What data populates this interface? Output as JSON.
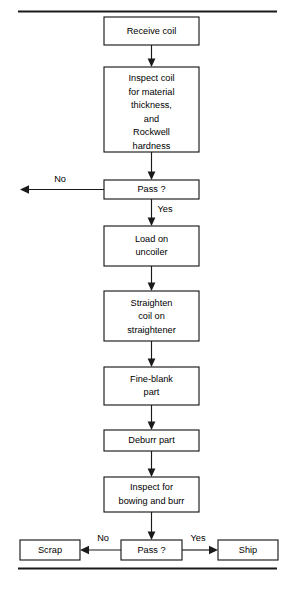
{
  "diagram": {
    "type": "flowchart",
    "orientation": "top-to-bottom",
    "background_color": "#ffffff",
    "line_color": "#1a1a1a",
    "text_color": "#000000",
    "rules": {
      "top_rule": "horizontal-rule-top",
      "bottom_rule": "horizontal-rule-bottom"
    },
    "nodes": [
      {
        "id": "receive-coil",
        "shape": "rect",
        "lines": [
          "Receive coil"
        ],
        "x": 104,
        "y": 17,
        "w": 95,
        "h": 28
      },
      {
        "id": "inspect-coil",
        "shape": "rect",
        "lines": [
          "Inspect coil",
          "for material",
          "thickness,",
          "and",
          "Rockwell",
          "hardness"
        ],
        "x": 104,
        "y": 67,
        "w": 95,
        "h": 85
      },
      {
        "id": "pass-1",
        "shape": "rect",
        "lines": [
          "Pass ?"
        ],
        "x": 104,
        "y": 180,
        "w": 95,
        "h": 19
      },
      {
        "id": "load-on-uncoiler",
        "shape": "rect",
        "lines": [
          "Load on",
          "uncoiler"
        ],
        "x": 104,
        "y": 226,
        "w": 95,
        "h": 40
      },
      {
        "id": "straighten-coil",
        "shape": "rect",
        "lines": [
          "Straighten",
          "coil on",
          "straightener"
        ],
        "x": 104,
        "y": 291,
        "w": 95,
        "h": 50
      },
      {
        "id": "fine-blank-part",
        "shape": "rect",
        "lines": [
          "Fine-blank",
          "part"
        ],
        "x": 104,
        "y": 367,
        "w": 95,
        "h": 38
      },
      {
        "id": "deburr-part",
        "shape": "rect",
        "lines": [
          "Deburr part"
        ],
        "x": 104,
        "y": 430,
        "w": 95,
        "h": 21
      },
      {
        "id": "inspect-bowing-burr",
        "shape": "rect",
        "lines": [
          "Inspect for",
          "bowing and burr"
        ],
        "x": 104,
        "y": 477,
        "w": 95,
        "h": 35
      },
      {
        "id": "pass-2",
        "shape": "rect",
        "lines": [
          "Pass ?"
        ],
        "x": 121,
        "y": 540,
        "w": 61,
        "h": 20
      },
      {
        "id": "scrap",
        "shape": "rect",
        "lines": [
          "Scrap"
        ],
        "x": 20,
        "y": 540,
        "w": 60,
        "h": 20
      },
      {
        "id": "ship",
        "shape": "rect",
        "lines": [
          "Ship"
        ],
        "x": 218,
        "y": 540,
        "w": 60,
        "h": 20
      }
    ],
    "edges": [
      {
        "id": "e-receive-to-inspect",
        "from": "receive-coil",
        "to": "inspect-coil",
        "label": "",
        "direction": "down"
      },
      {
        "id": "e-inspect-to-pass1",
        "from": "inspect-coil",
        "to": "pass-1",
        "label": "",
        "direction": "down"
      },
      {
        "id": "e-pass1-no",
        "from": "pass-1",
        "to": "exit-left",
        "label": "No",
        "direction": "left"
      },
      {
        "id": "e-pass1-yes",
        "from": "pass-1",
        "to": "load-on-uncoiler",
        "label": "Yes",
        "direction": "down"
      },
      {
        "id": "e-load-to-straighten",
        "from": "load-on-uncoiler",
        "to": "straighten-coil",
        "label": "",
        "direction": "down"
      },
      {
        "id": "e-straighten-to-fineblank",
        "from": "straighten-coil",
        "to": "fine-blank-part",
        "label": "",
        "direction": "down"
      },
      {
        "id": "e-fineblank-to-deburr",
        "from": "fine-blank-part",
        "to": "deburr-part",
        "label": "",
        "direction": "down"
      },
      {
        "id": "e-deburr-to-inspect2",
        "from": "deburr-part",
        "to": "inspect-bowing-burr",
        "label": "",
        "direction": "down"
      },
      {
        "id": "e-inspect2-to-pass2",
        "from": "inspect-bowing-burr",
        "to": "pass-2",
        "label": "",
        "direction": "down"
      },
      {
        "id": "e-pass2-no",
        "from": "pass-2",
        "to": "scrap",
        "label": "No",
        "direction": "left"
      },
      {
        "id": "e-pass2-yes",
        "from": "pass-2",
        "to": "ship",
        "label": "Yes",
        "direction": "right"
      }
    ],
    "labels": {
      "no_1": "No",
      "yes_1": "Yes",
      "no_2": "No",
      "yes_2": "Yes"
    },
    "text": {
      "receive_coil": "Receive coil",
      "inspect_coil_l1": "Inspect coil",
      "inspect_coil_l2": "for material",
      "inspect_coil_l3": "thickness,",
      "inspect_coil_l4": "and",
      "inspect_coil_l5": "Rockwell",
      "inspect_coil_l6": "hardness",
      "pass_1": "Pass ?",
      "load_l1": "Load on",
      "load_l2": "uncoiler",
      "straighten_l1": "Straighten",
      "straighten_l2": "coil on",
      "straighten_l3": "straightener",
      "fineblank_l1": "Fine-blank",
      "fineblank_l2": "part",
      "deburr": "Deburr part",
      "inspect2_l1": "Inspect for",
      "inspect2_l2": "bowing and burr",
      "pass_2": "Pass ?",
      "scrap": "Scrap",
      "ship": "Ship"
    }
  }
}
